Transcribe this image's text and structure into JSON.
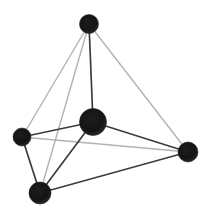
{
  "figure": {
    "name": "tetrahedron-with-central-sphere",
    "canvas": {
      "width": 211,
      "height": 218
    },
    "colors": {
      "background": "#ffffff",
      "edge_light": "#b3b3b3",
      "edge_dark": "#3d3d3d",
      "sphere_core": "#111111",
      "sphere_rim": "#2b2b2b"
    },
    "style": {
      "edge_light_width": 1.4,
      "edge_dark_width": 1.7
    },
    "nodes": [
      {
        "id": "top",
        "x": 89,
        "y": 24,
        "r": 9.5
      },
      {
        "id": "left",
        "x": 22,
        "y": 137,
        "r": 9
      },
      {
        "id": "right",
        "x": 188,
        "y": 152,
        "r": 10
      },
      {
        "id": "bottom",
        "x": 40,
        "y": 193,
        "r": 11
      },
      {
        "id": "center",
        "x": 93,
        "y": 122,
        "r": 13.5
      }
    ],
    "edges": [
      {
        "from": "top",
        "to": "left",
        "shade": "light"
      },
      {
        "from": "top",
        "to": "right",
        "shade": "light"
      },
      {
        "from": "top",
        "to": "bottom",
        "shade": "light"
      },
      {
        "from": "left",
        "to": "right",
        "shade": "light"
      },
      {
        "from": "top",
        "to": "center",
        "shade": "dark"
      },
      {
        "from": "left",
        "to": "center",
        "shade": "dark"
      },
      {
        "from": "left",
        "to": "bottom",
        "shade": "dark"
      },
      {
        "from": "right",
        "to": "center",
        "shade": "dark"
      },
      {
        "from": "right",
        "to": "bottom",
        "shade": "dark"
      },
      {
        "from": "bottom",
        "to": "center",
        "shade": "dark"
      }
    ]
  }
}
